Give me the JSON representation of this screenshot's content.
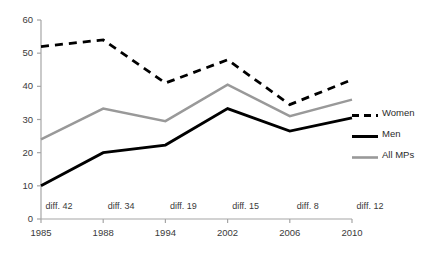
{
  "chart_data": {
    "type": "line",
    "title": "",
    "xlabel": "",
    "ylabel": "",
    "categories": [
      "1985",
      "1988",
      "1994",
      "2002",
      "2006",
      "2010"
    ],
    "series": [
      {
        "name": "Women",
        "values": [
          52,
          54,
          41,
          48,
          34.5,
          42
        ],
        "color": "#000000",
        "style": "dashed"
      },
      {
        "name": "Men",
        "values": [
          10,
          20,
          22.3,
          33.3,
          26.5,
          30.5
        ],
        "color": "#000000",
        "style": "solid"
      },
      {
        "name": "All MPs",
        "values": [
          24,
          33.3,
          29.5,
          40.5,
          31,
          36
        ],
        "color": "#999999",
        "style": "solid"
      }
    ],
    "ylim": [
      0,
      60
    ],
    "yticks": [
      0,
      10,
      20,
      30,
      40,
      50,
      60
    ],
    "ytick_labels": [
      "0",
      "10",
      "20",
      "30",
      "40",
      "50",
      "60"
    ],
    "grid": false,
    "legend_position": "right",
    "annotations": [
      {
        "text": "diff. 42",
        "category": "1985"
      },
      {
        "text": "diff. 34",
        "category": "1988"
      },
      {
        "text": "diff. 19",
        "category": "1994"
      },
      {
        "text": "diff. 15",
        "category": "2002"
      },
      {
        "text": "diff. 8",
        "category": "2006"
      },
      {
        "text": "diff. 12",
        "category": "2010"
      }
    ]
  },
  "axis": {
    "line_color": "#a6a6a6"
  }
}
